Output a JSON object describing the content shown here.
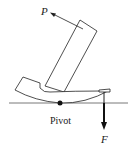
{
  "diagram": {
    "type": "lever / claw hammer pulling a nail",
    "labels": {
      "applied_force": "P",
      "pivot": "Pivot",
      "resisting_force": "F"
    },
    "colors": {
      "stroke": "#222222",
      "background": "#ffffff"
    }
  }
}
